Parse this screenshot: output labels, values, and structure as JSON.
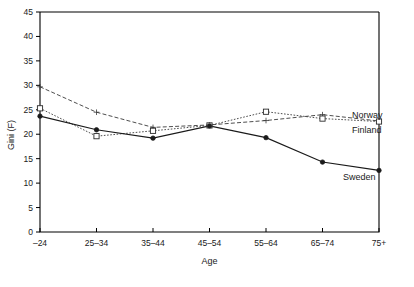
{
  "chart_data": {
    "type": "line",
    "title": "",
    "xlabel": "Age",
    "ylabel": "Gini (F)",
    "categories": [
      "–24",
      "25–34",
      "35–44",
      "45–54",
      "55–64",
      "65–74",
      "75+"
    ],
    "ylim": [
      0,
      45
    ],
    "yticks": [
      0,
      5,
      10,
      15,
      20,
      25,
      30,
      35,
      40,
      45
    ],
    "grid": false,
    "legend_position": "inline-right",
    "series": [
      {
        "name": "Norway",
        "values": [
          29.7,
          24.5,
          21.4,
          21.9,
          22.8,
          24.0,
          22.7
        ],
        "marker": "plus",
        "line_style": "dashed",
        "color": "#3a3a3a"
      },
      {
        "name": "Finland",
        "values": [
          25.3,
          19.6,
          20.7,
          21.8,
          24.6,
          23.2,
          22.6
        ],
        "marker": "open-square",
        "line_style": "dotted",
        "color": "#3a3a3a"
      },
      {
        "name": "Sweden",
        "values": [
          23.7,
          20.9,
          19.2,
          21.7,
          19.3,
          14.3,
          12.6
        ],
        "marker": "filled-circle",
        "line_style": "solid",
        "color": "#1a1a1a"
      }
    ],
    "annotations": [
      {
        "text": "Norway",
        "series": "Norway"
      },
      {
        "text": "Finland",
        "series": "Finland"
      },
      {
        "text": "Sweden",
        "series": "Sweden"
      }
    ]
  }
}
